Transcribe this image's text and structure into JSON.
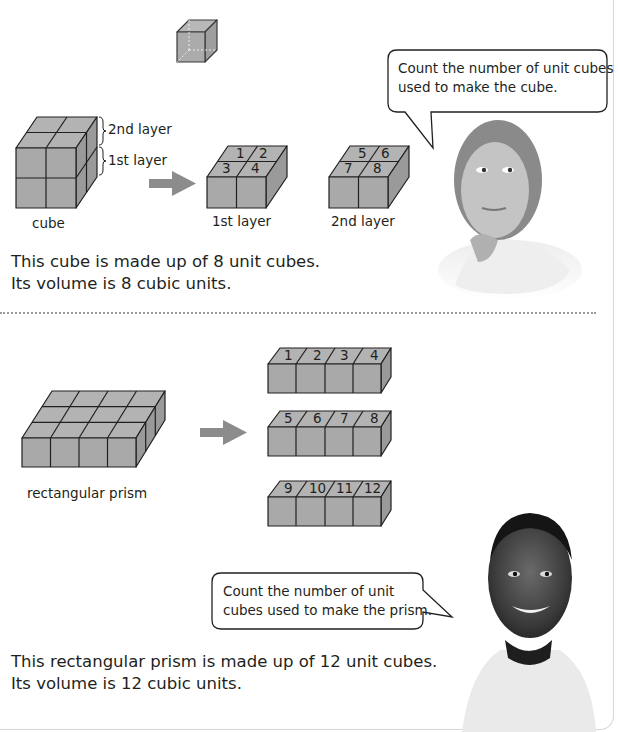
{
  "section1": {
    "unit_cube_caption": "",
    "labels": {
      "second_layer": "2nd layer",
      "first_layer": "1st layer",
      "cube": "cube",
      "first_layer_caption": "1st layer",
      "second_layer_caption": "2nd layer"
    },
    "first_layer_numbers": [
      "1",
      "2",
      "3",
      "4"
    ],
    "second_layer_numbers": [
      "5",
      "6",
      "7",
      "8"
    ],
    "speech_bubble": {
      "line1": "Count the number of unit cubes",
      "line2": "used to make the cube."
    },
    "paragraph": {
      "line1": "This cube is made up of 8 unit cubes.",
      "line2": "Its volume is 8 cubic units."
    }
  },
  "section2": {
    "labels": {
      "prism": "rectangular prism"
    },
    "rows": [
      [
        "1",
        "2",
        "3",
        "4"
      ],
      [
        "5",
        "6",
        "7",
        "8"
      ],
      [
        "9",
        "10",
        "11",
        "12"
      ]
    ],
    "speech_bubble": {
      "line1": "Count the number of unit",
      "line2": "cubes used to make the prism."
    },
    "paragraph": {
      "line1": "This rectangular prism is made up of 12 unit cubes.",
      "line2": "Its volume is 12 cubic units."
    }
  },
  "colors": {
    "cube_fill": "#a9a9a9",
    "cube_top": "#b4b4b4",
    "cube_side": "#9c9c9c",
    "arrow": "#8c8c8c",
    "stroke": "#231f20"
  }
}
